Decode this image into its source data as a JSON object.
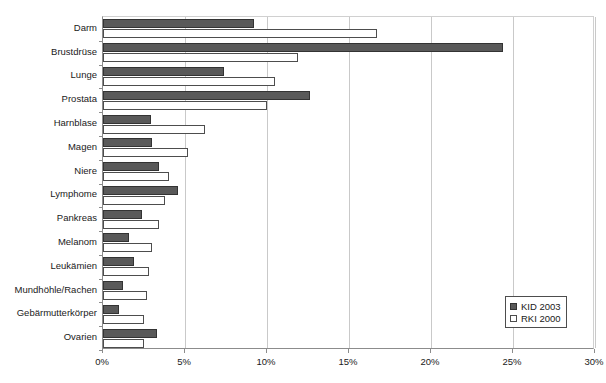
{
  "chart_data": {
    "type": "bar",
    "orientation": "horizontal",
    "title": "",
    "xlabel": "",
    "ylabel": "",
    "xlim": [
      0,
      30
    ],
    "xunit": "%",
    "xticks": [
      0,
      5,
      10,
      15,
      20,
      25,
      30
    ],
    "xtick_labels": [
      "0%",
      "5%",
      "10%",
      "15%",
      "20%",
      "25%",
      "30%"
    ],
    "grid": true,
    "grid_axis": "x",
    "legend_position": "bottom-right",
    "categories": [
      "Darm",
      "Brustdrüse",
      "Lunge",
      "Prostata",
      "Harnblase",
      "Magen",
      "Niere",
      "Lymphome",
      "Pankreas",
      "Melanom",
      "Leukämien",
      "Mundhöhle/Rachen",
      "Gebärmutterkörper",
      "Ovarien"
    ],
    "series": [
      {
        "name": "KID 2003",
        "color": "#595959",
        "border": "#333333",
        "values": [
          9.2,
          24.4,
          7.4,
          12.6,
          2.9,
          3.0,
          3.4,
          4.6,
          2.4,
          1.6,
          1.9,
          1.2,
          1.0,
          3.3
        ]
      },
      {
        "name": "RKI 2000",
        "color": "#ffffff",
        "border": "#4d4d4d",
        "values": [
          16.7,
          11.9,
          10.5,
          10.0,
          6.2,
          5.2,
          4.0,
          3.8,
          3.4,
          3.0,
          2.8,
          2.7,
          2.5,
          2.5
        ]
      }
    ]
  },
  "legend": {
    "items": [
      {
        "label": "KID 2003",
        "swatch": "kid"
      },
      {
        "label": "RKI 2000",
        "swatch": "rki"
      }
    ]
  }
}
